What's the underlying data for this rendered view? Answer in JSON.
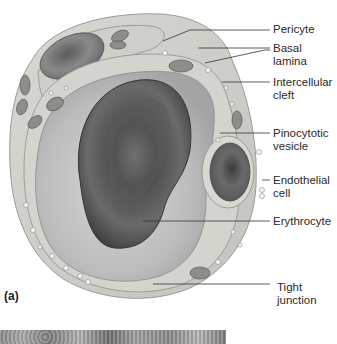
{
  "figure": {
    "panel_label": "(a)",
    "labels": [
      {
        "id": "pericyte",
        "text": "Pericyte"
      },
      {
        "id": "basal-lamina",
        "text": "Basal\nlamina"
      },
      {
        "id": "intercellular-cleft",
        "text": "Intercellular\ncleft"
      },
      {
        "id": "pinocytotic-vesicle",
        "text": "Pinocytotic\nvesicle"
      },
      {
        "id": "endothelial-cell",
        "text": "Endothelial\ncell"
      },
      {
        "id": "erythrocyte",
        "text": "Erythrocyte"
      },
      {
        "id": "tight-junction",
        "text": "Tight\njunction"
      }
    ]
  },
  "colors": {
    "background": "#ffffff",
    "outer_wall": "#c9c9c4",
    "lumen": "#b7b7b7",
    "erythrocyte": "#555555",
    "leader_line": "#333333",
    "text": "#2a2a2a"
  }
}
